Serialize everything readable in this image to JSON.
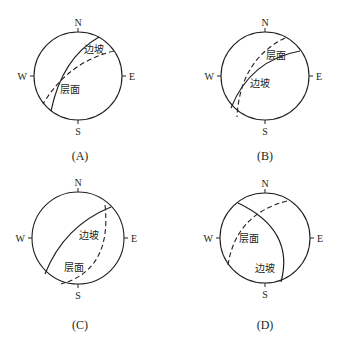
{
  "figure": {
    "directions": {
      "north": "N",
      "south": "S",
      "west": "W",
      "east": "E"
    },
    "legend_terms": {
      "slope": "边坡",
      "bedding": "层面"
    },
    "line_styles": {
      "slope": "solid",
      "bedding": "dashed"
    }
  },
  "panels": [
    {
      "id": "A",
      "caption": "(A)",
      "slope_label": "边坡",
      "bedding_label": "层面"
    },
    {
      "id": "B",
      "caption": "(B)",
      "slope_label": "边坡",
      "bedding_label": "层面"
    },
    {
      "id": "C",
      "caption": "(C)",
      "slope_label": "边坡",
      "bedding_label": "层面"
    },
    {
      "id": "D",
      "caption": "(D)",
      "slope_label": "边坡",
      "bedding_label": "层面"
    }
  ]
}
